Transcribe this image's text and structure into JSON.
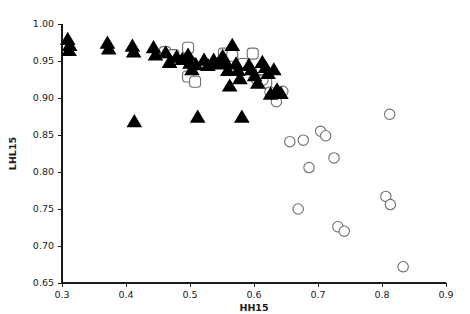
{
  "chart_data": {
    "type": "scatter",
    "title": "",
    "xlabel": "HH15",
    "ylabel": "LHL15",
    "xlim": [
      0.3,
      0.9
    ],
    "ylim": [
      0.65,
      1.0
    ],
    "xticks": [
      0.3,
      0.4,
      0.5,
      0.6,
      0.7,
      0.8,
      0.9
    ],
    "xtick_labels": [
      "0.3",
      "0.4",
      "0.5",
      "0.6",
      "0.7",
      "0.8",
      "0.9"
    ],
    "yticks": [
      0.65,
      0.7,
      0.75,
      0.8,
      0.85,
      0.9,
      0.95,
      1.0
    ],
    "ytick_labels": [
      "0.65",
      "0.70",
      "0.75",
      "0.80",
      "0.85",
      "0.90",
      "0.95",
      "1.00"
    ],
    "grid": false,
    "legend": "none",
    "colors": {
      "filled_triangle": "#000000",
      "open_marker_stroke": "#6e6e6e",
      "axis": "#1a1a1a",
      "background": "#ffffff"
    },
    "series": [
      {
        "name": "filled-triangles",
        "marker": "triangle-filled",
        "points": [
          [
            0.309,
            0.979
          ],
          [
            0.312,
            0.971
          ],
          [
            0.311,
            0.964
          ],
          [
            0.371,
            0.974
          ],
          [
            0.373,
            0.966
          ],
          [
            0.41,
            0.97
          ],
          [
            0.412,
            0.962
          ],
          [
            0.413,
            0.868
          ],
          [
            0.443,
            0.968
          ],
          [
            0.446,
            0.958
          ],
          [
            0.462,
            0.961
          ],
          [
            0.468,
            0.948
          ],
          [
            0.479,
            0.955
          ],
          [
            0.488,
            0.952
          ],
          [
            0.497,
            0.958
          ],
          [
            0.5,
            0.947
          ],
          [
            0.503,
            0.938
          ],
          [
            0.509,
            0.945
          ],
          [
            0.512,
            0.874
          ],
          [
            0.522,
            0.951
          ],
          [
            0.528,
            0.944
          ],
          [
            0.537,
            0.951
          ],
          [
            0.544,
            0.946
          ],
          [
            0.551,
            0.956
          ],
          [
            0.556,
            0.948
          ],
          [
            0.559,
            0.937
          ],
          [
            0.562,
            0.916
          ],
          [
            0.566,
            0.971
          ],
          [
            0.572,
            0.946
          ],
          [
            0.575,
            0.937
          ],
          [
            0.578,
            0.926
          ],
          [
            0.581,
            0.874
          ],
          [
            0.592,
            0.944
          ],
          [
            0.596,
            0.938
          ],
          [
            0.601,
            0.93
          ],
          [
            0.606,
            0.92
          ],
          [
            0.613,
            0.948
          ],
          [
            0.618,
            0.941
          ],
          [
            0.622,
            0.933
          ],
          [
            0.626,
            0.905
          ],
          [
            0.631,
            0.938
          ],
          [
            0.636,
            0.911
          ],
          [
            0.642,
            0.906
          ]
        ]
      },
      {
        "name": "open-rounded-squares",
        "marker": "rounded-square-open",
        "points": [
          [
            0.461,
            0.962
          ],
          [
            0.474,
            0.958
          ],
          [
            0.497,
            0.968
          ],
          [
            0.5,
            0.948
          ],
          [
            0.497,
            0.929
          ],
          [
            0.508,
            0.922
          ],
          [
            0.553,
            0.96
          ],
          [
            0.566,
            0.957
          ],
          [
            0.583,
            0.946
          ],
          [
            0.598,
            0.96
          ],
          [
            0.612,
            0.939
          ],
          [
            0.619,
            0.921
          ]
        ]
      },
      {
        "name": "open-circles",
        "marker": "circle-open",
        "points": [
          [
            0.604,
            0.925
          ],
          [
            0.614,
            0.924
          ],
          [
            0.625,
            0.908
          ],
          [
            0.635,
            0.895
          ],
          [
            0.645,
            0.909
          ],
          [
            0.656,
            0.841
          ],
          [
            0.669,
            0.75
          ],
          [
            0.677,
            0.843
          ],
          [
            0.686,
            0.806
          ],
          [
            0.704,
            0.855
          ],
          [
            0.712,
            0.849
          ],
          [
            0.725,
            0.819
          ],
          [
            0.731,
            0.726
          ],
          [
            0.741,
            0.72
          ],
          [
            0.806,
            0.767
          ],
          [
            0.813,
            0.756
          ],
          [
            0.812,
            0.878
          ],
          [
            0.833,
            0.672
          ]
        ]
      }
    ]
  }
}
